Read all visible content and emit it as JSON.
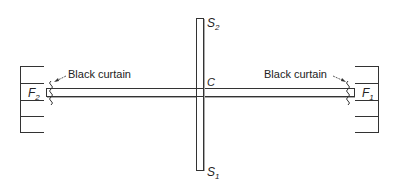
{
  "diagram": {
    "labels": {
      "s2": "S",
      "s2_sub": "2",
      "s1": "S",
      "s1_sub": "1",
      "c": "C",
      "f2": "F",
      "f2_sub": "2",
      "f1": "F",
      "f1_sub": "1",
      "curtain_left": "Black curtain",
      "curtain_right": "Black curtain"
    },
    "colors": {
      "line": "#333333",
      "shadow": "#aaaaaa",
      "background": "#ffffff"
    }
  }
}
